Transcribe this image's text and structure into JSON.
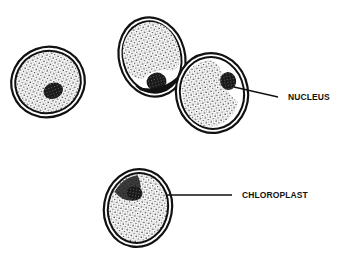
{
  "diagram": {
    "type": "biology-illustration",
    "colors": {
      "background": "#ffffff",
      "ink": "#111111",
      "cytoplasm": "#f4f4f4"
    },
    "cells": [
      {
        "id": "cell-1",
        "cx": 48,
        "cy": 82,
        "rx": 37,
        "ry": 35,
        "rotate": -20
      },
      {
        "id": "cell-2",
        "cx": 152,
        "cy": 57,
        "rx": 33,
        "ry": 40,
        "rotate": -15
      },
      {
        "id": "cell-3",
        "cx": 212,
        "cy": 93,
        "rx": 36,
        "ry": 40,
        "rotate": -10
      },
      {
        "id": "cell-4",
        "cx": 138,
        "cy": 208,
        "rx": 34,
        "ry": 39,
        "rotate": 10
      }
    ],
    "labels": [
      {
        "id": "nucleus",
        "text": "NUCLEUS",
        "x": 288,
        "y": 92
      },
      {
        "id": "chloroplast",
        "text": "CHLOROPLAST",
        "x": 242,
        "y": 190
      }
    ]
  }
}
